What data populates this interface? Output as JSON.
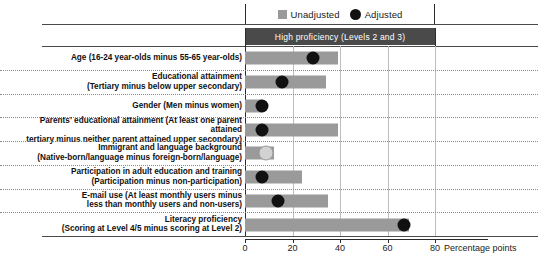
{
  "legend": {
    "items": [
      {
        "label": "Unadjusted",
        "marker": "square-swatch-icon",
        "color": "#9a9a9a"
      },
      {
        "label": "Adjusted",
        "marker": "circle-swatch-icon",
        "color": "#111111"
      }
    ]
  },
  "panel": {
    "header": "High proficiency (Levels 2 and 3)"
  },
  "axis": {
    "unit_label": "Percentage points",
    "ticks": [
      "0",
      "20",
      "40",
      "60",
      "80"
    ]
  },
  "chart_data": {
    "type": "bar",
    "orientation": "horizontal",
    "title": "High proficiency (Levels 2 and 3)",
    "xlabel": "Percentage points",
    "ylabel": "",
    "xlim": [
      0,
      80
    ],
    "xticks": [
      0,
      20,
      40,
      60,
      80
    ],
    "grid": true,
    "legend_position": "top",
    "categories": [
      "Age (16-24 year-olds minus 55-65 year-olds)",
      "Educational attainment\n(Tertiary minus below upper secondary)",
      "Gender (Men minus women)",
      "Parents' educational attainment (At least one parent attained\ntertiary minus neither parent attained upper secondary)",
      "Immigrant and language background\n(Native-born/language minus foreign-born/language)",
      "Participation in adult education and training\n(Participation minus non-participation)",
      "E-mail use (At least monthly users minus\nless than monthly users and non-users)",
      "Literacy proficiency\n(Scoring at Level 4/5 minus scoring at Level 2)"
    ],
    "series": [
      {
        "name": "Unadjusted",
        "type": "bar",
        "color": "#9a9a9a",
        "values": [
          39,
          34,
          7,
          39,
          12,
          24,
          35,
          69
        ]
      },
      {
        "name": "Adjusted",
        "type": "marker",
        "color": "#111111",
        "values": [
          28.5,
          15.5,
          7,
          7,
          9,
          7,
          14,
          67
        ],
        "marker_styles": [
          "filled",
          "filled",
          "filled",
          "filled",
          "light",
          "filled",
          "filled",
          "filled"
        ]
      }
    ]
  }
}
